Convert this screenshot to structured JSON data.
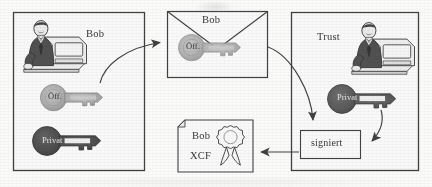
{
  "diagram": {
    "colors": {
      "stroke": "#3a3a3a",
      "box_fill": "#ffffff",
      "public_key_fill": "#a9a9a9",
      "private_key_fill": "#4a4a4a",
      "trust_private_key_fill": "#5a5a5a",
      "page_bg": "#fbfbfa",
      "text": "#2e2e2e"
    },
    "boxes": [
      {
        "id": "bob-box",
        "label": "Bob"
      },
      {
        "id": "trust-box",
        "label": "Trust"
      },
      {
        "id": "signiert-box",
        "label": "signiert"
      }
    ],
    "envelope": {
      "label": "Bob"
    },
    "certificate": {
      "line1": "Bob",
      "line2": "XCF",
      "seal": "ribbon-seal"
    },
    "keys": [
      {
        "id": "bob-public-key",
        "label": "Öff.",
        "kind": "public",
        "owner": "Bob"
      },
      {
        "id": "bob-private-key",
        "label": "Privat",
        "kind": "private",
        "owner": "Bob"
      },
      {
        "id": "envelope-public-key",
        "label": "Öff.",
        "kind": "public",
        "owner": "Bob"
      },
      {
        "id": "trust-private-key",
        "label": "Privat",
        "kind": "private",
        "owner": "Trust"
      }
    ],
    "people": [
      {
        "id": "bob-person",
        "description": "person-at-computer"
      },
      {
        "id": "trust-person",
        "description": "person-at-computer"
      }
    ],
    "arrows": [
      {
        "id": "arrow-bob-to-envelope",
        "from": "bob-public-key",
        "to": "envelope",
        "style": "curved"
      },
      {
        "id": "arrow-envelope-to-signiert",
        "from": "envelope",
        "to": "signiert-box",
        "style": "curved"
      },
      {
        "id": "arrow-trustkey-to-signiert",
        "from": "trust-private-key",
        "to": "signiert-box",
        "style": "curved"
      },
      {
        "id": "arrow-signiert-to-certificate",
        "from": "signiert-box",
        "to": "certificate",
        "style": "straight"
      }
    ]
  }
}
